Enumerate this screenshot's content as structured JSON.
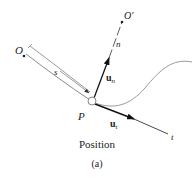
{
  "figure": {
    "caption": "Position",
    "sublabel": "(a)"
  },
  "labels": {
    "origin": "O",
    "center_of_curvature": "O′",
    "normal_axis": "n",
    "tangent_axis": "t",
    "arc_length": "s",
    "point": "P",
    "normal_unit_vector": "u",
    "normal_unit_vector_sub": "n",
    "tangent_unit_vector": "u",
    "tangent_unit_vector_sub": "t"
  },
  "colors": {
    "line": "#222222",
    "curve": "#9a9a9a",
    "arrow": "#111111"
  }
}
